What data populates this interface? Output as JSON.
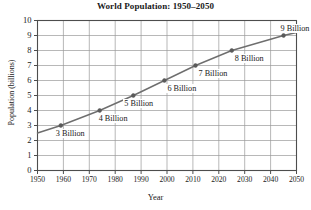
{
  "chart_data": {
    "type": "line",
    "title": "World Population: 1950–2050",
    "xlabel": "Year",
    "ylabel": "Population (billions)",
    "xlim": [
      1950,
      2050
    ],
    "ylim": [
      0,
      10
    ],
    "grid": true,
    "legend": false,
    "line_color": "#6e6e6e",
    "marker_color": "#5a5a5a",
    "grid_color": "#9a9a9a",
    "axis_color": "#4d4d4d",
    "xticks": [
      1950,
      1960,
      1970,
      1980,
      1990,
      2000,
      2010,
      2020,
      2030,
      2040,
      2050
    ],
    "yticks": [
      0,
      1,
      2,
      3,
      4,
      5,
      6,
      7,
      8,
      9,
      10
    ],
    "x": [
      1950,
      1959,
      1974,
      1987,
      1999,
      2011,
      2025,
      2045,
      2050
    ],
    "values": [
      2.5,
      3.0,
      4.0,
      5.0,
      6.0,
      7.0,
      8.0,
      9.0,
      9.2
    ],
    "points": [
      {
        "x": 1959,
        "y": 3,
        "label": "3 Billion"
      },
      {
        "x": 1974,
        "y": 4,
        "label": "4 Billion"
      },
      {
        "x": 1987,
        "y": 5,
        "label": "5 Billion"
      },
      {
        "x": 1999,
        "y": 6,
        "label": "6 Billion"
      },
      {
        "x": 2011,
        "y": 7,
        "label": "7 Billion"
      },
      {
        "x": 2025,
        "y": 8,
        "label": "8 Billion"
      },
      {
        "x": 2045,
        "y": 9,
        "label": "9 Billion"
      }
    ]
  }
}
